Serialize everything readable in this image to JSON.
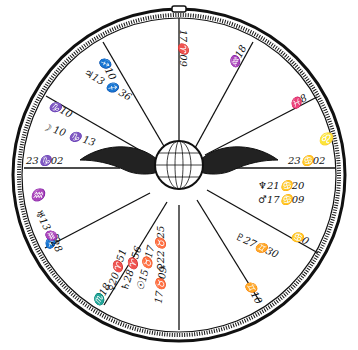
{
  "figure": {
    "type": "horoscope-wheel-engraving",
    "center_emblem": "winged-globe",
    "colors": {
      "ink": "#111111",
      "paper": "#ffffff"
    }
  },
  "cusps": [
    {
      "id": "top",
      "text": "17♈09"
    },
    {
      "id": "upper-right-1",
      "text": "♒18"
    },
    {
      "id": "upper-right-2",
      "text": "♓8"
    },
    {
      "id": "right",
      "text": "23♋02"
    },
    {
      "id": "lower-right-1",
      "text": "♋0"
    },
    {
      "id": "lower-right-2",
      "text": "♊10"
    },
    {
      "id": "left",
      "text": "23♑02"
    },
    {
      "id": "upper-left-1",
      "text": "♑10"
    },
    {
      "id": "upper-left-2",
      "text": "♐10"
    },
    {
      "id": "lower-left-1",
      "text": "♐8"
    },
    {
      "id": "lower-left-2",
      "text": "♏18"
    }
  ],
  "planets": [
    {
      "id": "jupiter",
      "text": "♃13 ♐ 36"
    },
    {
      "id": "moon",
      "text": "☽ 10 ♑ 13"
    },
    {
      "id": "neptune",
      "text": "♆21♋20"
    },
    {
      "id": "mars",
      "text": "♂17♋09"
    },
    {
      "id": "pluto",
      "text": "♇27♊30"
    },
    {
      "id": "venus",
      "text": "♀22♉25"
    },
    {
      "id": "uranus",
      "text": "♅13♒28"
    },
    {
      "id": "mercury",
      "text": "☿20♈51"
    },
    {
      "id": "saturn",
      "text": "♄28♈56"
    },
    {
      "id": "sun",
      "text": "☉15♉17"
    },
    {
      "id": "asc",
      "text": "17♉09"
    }
  ],
  "side_glyphs": {
    "left": "♒",
    "right": "♌"
  }
}
